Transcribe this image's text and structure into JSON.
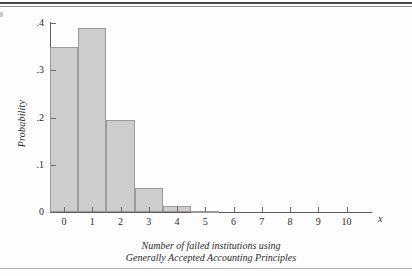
{
  "chart_data": {
    "type": "bar",
    "title": "",
    "subtitle": "",
    "xlabel_lines": [
      "Number of failed institutions using",
      "Generally Accepted Accounting Principles"
    ],
    "ylabel": "Probability",
    "x_variable_symbol": "x",
    "categories": [
      "0",
      "1",
      "2",
      "3",
      "4",
      "5",
      "6",
      "7",
      "8",
      "9",
      "10"
    ],
    "values": [
      0.35,
      0.39,
      0.195,
      0.05,
      0.013,
      0.002,
      0,
      0,
      0,
      0,
      0
    ],
    "xlim": [
      -0.5,
      10.9
    ],
    "ylim": [
      0,
      0.405
    ],
    "y_ticks": [
      0,
      0.1,
      0.2,
      0.3,
      0.4
    ],
    "y_tick_labels": [
      "0",
      ".1",
      ".2",
      ".3",
      ".4"
    ],
    "x_ticks": [
      0,
      1,
      2,
      3,
      4,
      5,
      6,
      7,
      8,
      9,
      10
    ],
    "x_tick_labels": [
      "0",
      "1",
      "2",
      "3",
      "4",
      "5",
      "6",
      "7",
      "8",
      "9",
      "10"
    ],
    "grid": false,
    "legend": false,
    "bar_fill_color": "#cdcdcd",
    "bar_border_color": "#9a9a9a",
    "axis_color": "#5d5d5d"
  }
}
